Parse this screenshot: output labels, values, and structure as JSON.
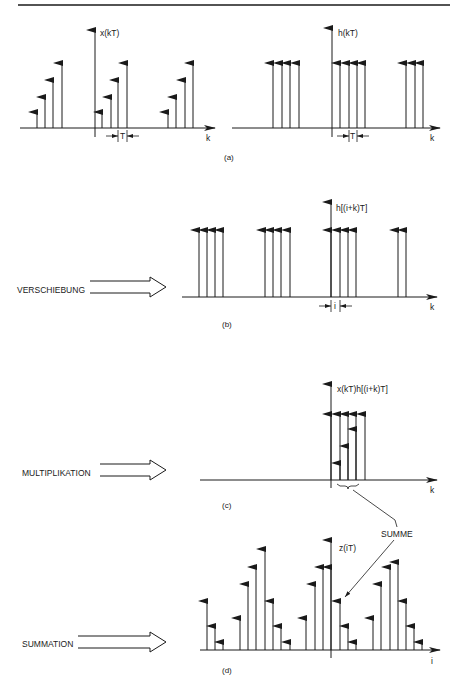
{
  "header_rule": true,
  "panels": {
    "a": {
      "caption": "(a)",
      "left": {
        "ylabel": "x(kT)",
        "xlabel": "k",
        "spacing_label": "T",
        "axis_y": 128,
        "axis_x0": 20,
        "axis_x1": 215,
        "vaxis_x": 95,
        "vaxis_top": 30,
        "vaxis_bottom": 137,
        "impulses": [
          {
            "x": 37,
            "top": 112
          },
          {
            "x": 45,
            "top": 97
          },
          {
            "x": 53,
            "top": 80
          },
          {
            "x": 62,
            "top": 63
          },
          {
            "x": 102,
            "top": 112
          },
          {
            "x": 111,
            "top": 97
          },
          {
            "x": 118,
            "top": 80
          },
          {
            "x": 127,
            "top": 63
          },
          {
            "x": 168,
            "top": 112
          },
          {
            "x": 176,
            "top": 97
          },
          {
            "x": 185,
            "top": 80
          },
          {
            "x": 193,
            "top": 63
          }
        ],
        "spacing_marker": {
          "x0": 118,
          "x1": 127,
          "y": 136
        }
      },
      "right": {
        "ylabel": "h(kT)",
        "xlabel": "k",
        "spacing_label": "T",
        "axis_y": 128,
        "axis_x0": 232,
        "axis_x1": 440,
        "vaxis_x": 332,
        "vaxis_top": 28,
        "vaxis_bottom": 137,
        "impulses": [
          {
            "x": 273,
            "top": 63
          },
          {
            "x": 282,
            "top": 63
          },
          {
            "x": 290,
            "top": 63
          },
          {
            "x": 299,
            "top": 63
          },
          {
            "x": 340,
            "top": 63
          },
          {
            "x": 349,
            "top": 63
          },
          {
            "x": 357,
            "top": 63
          },
          {
            "x": 365,
            "top": 63
          },
          {
            "x": 406,
            "top": 63
          },
          {
            "x": 415,
            "top": 63
          },
          {
            "x": 423,
            "top": 63
          }
        ],
        "spacing_marker": {
          "x0": 349,
          "x1": 357,
          "y": 136
        }
      }
    },
    "b": {
      "caption": "(b)",
      "side_label": "VERSCHIEBUNG",
      "ylabel": "h[(i+k)T]",
      "xlabel": "k",
      "spacing_label": "i",
      "axis_y": 297,
      "axis_x0": 182,
      "axis_x1": 437,
      "vaxis_x": 331,
      "vaxis_top": 202,
      "vaxis_bottom": 297,
      "impulses": [
        {
          "x": 199,
          "top": 230
        },
        {
          "x": 207,
          "top": 230
        },
        {
          "x": 215,
          "top": 230
        },
        {
          "x": 223,
          "top": 230
        },
        {
          "x": 265,
          "top": 230
        },
        {
          "x": 273,
          "top": 230
        },
        {
          "x": 281,
          "top": 230
        },
        {
          "x": 290,
          "top": 230
        },
        {
          "x": 331,
          "top": 230
        },
        {
          "x": 340,
          "top": 230
        },
        {
          "x": 348,
          "top": 230
        },
        {
          "x": 356,
          "top": 230
        },
        {
          "x": 398,
          "top": 230
        },
        {
          "x": 406,
          "top": 230
        }
      ],
      "spacing_marker": {
        "x0": 331,
        "x1": 340,
        "y": 306
      }
    },
    "c": {
      "caption": "(c)",
      "side_label": "MULTIPLIKATION",
      "ylabel": "x(kT)h[(i+k)T]",
      "xlabel": "k",
      "axis_y": 480,
      "axis_x0": 200,
      "axis_x1": 437,
      "vaxis_x": 331,
      "vaxis_top": 384,
      "vaxis_bottom": 488,
      "impulses_tall": [
        {
          "x": 331,
          "top": 414
        },
        {
          "x": 340,
          "top": 414
        },
        {
          "x": 348,
          "top": 414
        },
        {
          "x": 356,
          "top": 414
        },
        {
          "x": 365,
          "top": 414
        }
      ],
      "impulses_product": [
        {
          "x": 340,
          "top": 463
        },
        {
          "x": 348,
          "top": 446
        },
        {
          "x": 356,
          "top": 429
        }
      ],
      "brace": {
        "x0": 337,
        "x1": 359,
        "y": 484
      }
    },
    "d": {
      "caption": "(d)",
      "side_label": "SUMMATION",
      "ylabel": "z(iT)",
      "xlabel": "i",
      "summe_label": "SUMME",
      "axis_y": 650,
      "axis_x0": 200,
      "axis_x1": 440,
      "vaxis_x": 331,
      "vaxis_top": 540,
      "vaxis_bottom": 658,
      "impulses": [
        {
          "x": 207,
          "top": 601
        },
        {
          "x": 215,
          "top": 626
        },
        {
          "x": 223,
          "top": 642
        },
        {
          "x": 240,
          "top": 618
        },
        {
          "x": 248,
          "top": 584
        },
        {
          "x": 256,
          "top": 567
        },
        {
          "x": 265,
          "top": 549
        },
        {
          "x": 273,
          "top": 601
        },
        {
          "x": 281,
          "top": 626
        },
        {
          "x": 290,
          "top": 642
        },
        {
          "x": 306,
          "top": 618
        },
        {
          "x": 315,
          "top": 584
        },
        {
          "x": 323,
          "top": 567
        },
        {
          "x": 331,
          "top": 567
        },
        {
          "x": 340,
          "top": 601
        },
        {
          "x": 348,
          "top": 626
        },
        {
          "x": 356,
          "top": 642
        },
        {
          "x": 373,
          "top": 618
        },
        {
          "x": 381,
          "top": 584
        },
        {
          "x": 390,
          "top": 567
        },
        {
          "x": 398,
          "top": 562
        },
        {
          "x": 406,
          "top": 601
        },
        {
          "x": 414,
          "top": 626
        },
        {
          "x": 422,
          "top": 642
        }
      ]
    }
  },
  "colors": {
    "ink": "#1a1a1a",
    "background": "#ffffff"
  }
}
